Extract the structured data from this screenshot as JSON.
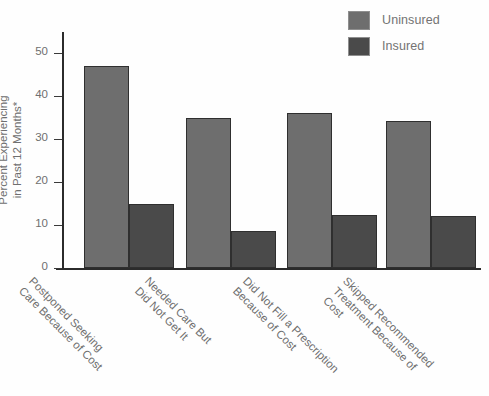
{
  "chart_data": {
    "type": "bar",
    "title": "",
    "xlabel": "",
    "ylabel": "Percent Experiencing\nin Past 12 Months*",
    "ylim": [
      0,
      55
    ],
    "yticks": [
      0,
      10,
      20,
      30,
      40,
      50
    ],
    "ytick_labels": [
      "0",
      "10",
      "20",
      "30",
      "40",
      "50"
    ],
    "grid": false,
    "legend_position": "top-right",
    "categories": [
      "Postponed Seeking\nCare Because of Cost",
      "Needed Care But\nDid Not Get It",
      "Did Not Fill a Prescription\nBecause of Cost",
      "Skipped Recommended\nTreatment Because of Cost"
    ],
    "series": [
      {
        "name": "Uninsured",
        "color": "#6e6e6e",
        "values": [
          47.0,
          35.0,
          36.2,
          34.3
        ]
      },
      {
        "name": "Insured",
        "color": "#4a4a4a",
        "values": [
          15.0,
          8.7,
          12.4,
          12.2
        ]
      }
    ]
  },
  "legend": {
    "items": [
      {
        "label": "Uninsured",
        "color": "#6e6e6e"
      },
      {
        "label": "Insured",
        "color": "#4a4a4a"
      }
    ]
  },
  "colors": {
    "uninsured": "#6e6e6e",
    "insured": "#4a4a4a",
    "axis": "#2b2b2b",
    "text": "#6f6f6f",
    "background": "#fefefe"
  }
}
